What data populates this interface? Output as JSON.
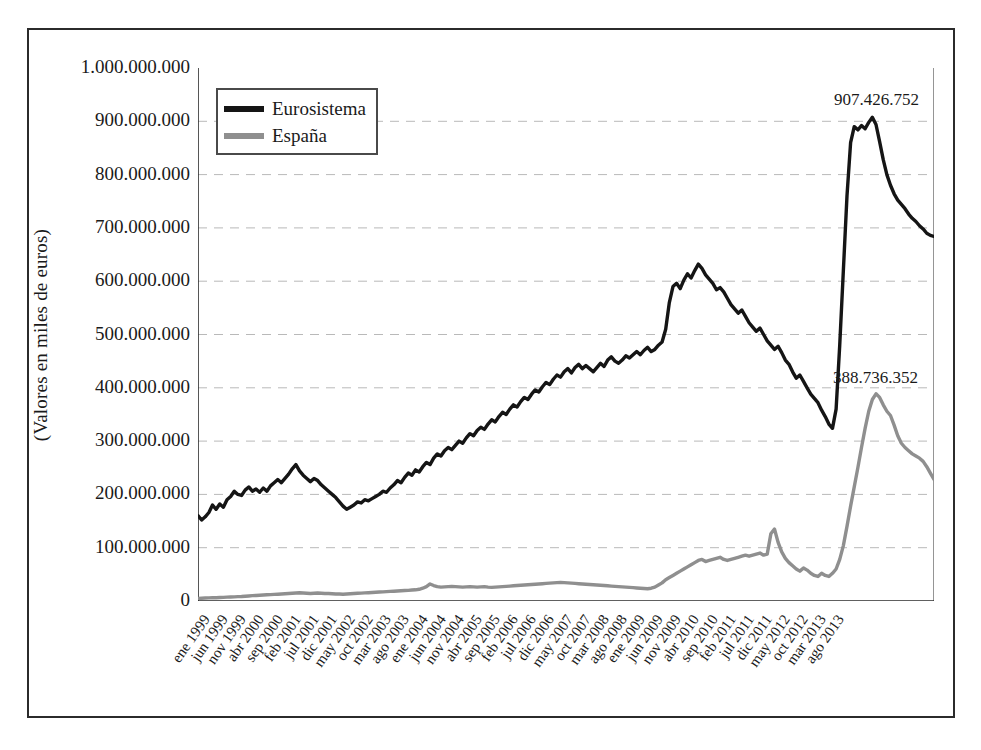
{
  "chart_data": {
    "type": "line",
    "title": "",
    "subtitle": "",
    "xlabel": "",
    "ylabel": "(Valores en miles de euros)",
    "ylim": [
      0,
      1000000000
    ],
    "ytick_step": 100000000,
    "grid": "horizontal-dashed",
    "legend_position": "top-left-inside",
    "x_axis_unit": "month",
    "x_start": "ene 1999",
    "x_end": "ago 2013",
    "x_tick_interval_months": 5,
    "y_tick_labels": [
      "1.000.000.000",
      "900.000.000",
      "800.000.000",
      "700.000.000",
      "600.000.000",
      "500.000.000",
      "400.000.000",
      "300.000.000",
      "200.000.000",
      "100.000.000",
      "0"
    ],
    "y_tick_values": [
      1000000000,
      900000000,
      800000000,
      700000000,
      600000000,
      500000000,
      400000000,
      300000000,
      200000000,
      100000000,
      0
    ],
    "xtick_labels": [
      "ene 1999",
      "jun 1999",
      "nov 1999",
      "abr 2000",
      "sep 2000",
      "feb 2001",
      "jul 2001",
      "dic 2001",
      "may 2002",
      "oct 2002",
      "mar 2003",
      "ago 2003",
      "ene 2004",
      "jun 2004",
      "nov 2004",
      "abr 2005",
      "sep 2005",
      "feb 2006",
      "jul 2006",
      "dic 2006",
      "may 2007",
      "oct 2007",
      "mar 2008",
      "ago 2008",
      "ene 2009",
      "jun 2009",
      "nov 2009",
      "abr 2010",
      "sep 2010",
      "feb 2011",
      "jul 2011",
      "dic 2011",
      "may 2012",
      "oct 2012",
      "mar 2013",
      "ago 2013"
    ],
    "series": [
      {
        "name": "Eurosistema",
        "color": "#151515",
        "values": [
          160000000,
          152000000,
          158000000,
          166000000,
          180000000,
          172000000,
          182000000,
          176000000,
          190000000,
          196000000,
          206000000,
          200000000,
          198000000,
          208000000,
          214000000,
          206000000,
          210000000,
          204000000,
          212000000,
          206000000,
          216000000,
          222000000,
          228000000,
          222000000,
          230000000,
          238000000,
          248000000,
          256000000,
          244000000,
          236000000,
          230000000,
          224000000,
          230000000,
          226000000,
          218000000,
          212000000,
          206000000,
          200000000,
          194000000,
          186000000,
          178000000,
          172000000,
          176000000,
          180000000,
          186000000,
          184000000,
          190000000,
          188000000,
          192000000,
          196000000,
          200000000,
          206000000,
          204000000,
          212000000,
          218000000,
          226000000,
          222000000,
          232000000,
          240000000,
          236000000,
          246000000,
          242000000,
          252000000,
          260000000,
          256000000,
          268000000,
          276000000,
          272000000,
          282000000,
          288000000,
          284000000,
          292000000,
          300000000,
          296000000,
          306000000,
          314000000,
          310000000,
          320000000,
          326000000,
          322000000,
          332000000,
          340000000,
          336000000,
          346000000,
          354000000,
          350000000,
          360000000,
          368000000,
          364000000,
          374000000,
          382000000,
          378000000,
          388000000,
          396000000,
          392000000,
          402000000,
          410000000,
          406000000,
          416000000,
          424000000,
          420000000,
          430000000,
          436000000,
          428000000,
          438000000,
          444000000,
          436000000,
          442000000,
          436000000,
          430000000,
          438000000,
          446000000,
          440000000,
          452000000,
          458000000,
          450000000,
          446000000,
          452000000,
          460000000,
          456000000,
          462000000,
          468000000,
          462000000,
          470000000,
          476000000,
          468000000,
          472000000,
          480000000,
          486000000,
          510000000,
          560000000,
          590000000,
          596000000,
          586000000,
          602000000,
          614000000,
          606000000,
          620000000,
          632000000,
          624000000,
          612000000,
          604000000,
          596000000,
          584000000,
          588000000,
          580000000,
          568000000,
          556000000,
          548000000,
          540000000,
          546000000,
          534000000,
          522000000,
          514000000,
          506000000,
          512000000,
          500000000,
          488000000,
          480000000,
          472000000,
          478000000,
          466000000,
          452000000,
          444000000,
          430000000,
          418000000,
          424000000,
          412000000,
          400000000,
          388000000,
          380000000,
          372000000,
          358000000,
          346000000,
          332000000,
          324000000,
          360000000,
          480000000,
          620000000,
          760000000,
          860000000,
          890000000,
          884000000,
          892000000,
          886000000,
          898000000,
          907426752,
          894000000,
          862000000,
          828000000,
          800000000,
          780000000,
          764000000,
          752000000,
          744000000,
          736000000,
          726000000,
          718000000,
          712000000,
          704000000,
          698000000,
          690000000,
          686000000,
          684000000
        ]
      },
      {
        "name": "España",
        "color": "#8f8f8f",
        "values": [
          5000000,
          5200000,
          5500000,
          5800000,
          6000000,
          6200000,
          6500000,
          6800000,
          7200000,
          7500000,
          7800000,
          8200000,
          8500000,
          9000000,
          9500000,
          10000000,
          10400000,
          10800000,
          11200000,
          11600000,
          12000000,
          12400000,
          12800000,
          13200000,
          13600000,
          14000000,
          14500000,
          15000000,
          15400000,
          15000000,
          14600000,
          14200000,
          14600000,
          15000000,
          14600000,
          14200000,
          14000000,
          13600000,
          13200000,
          13000000,
          12800000,
          13200000,
          13600000,
          14000000,
          14400000,
          14800000,
          15200000,
          15600000,
          16000000,
          16400000,
          16800000,
          17200000,
          17600000,
          18000000,
          18400000,
          18800000,
          19200000,
          19600000,
          20000000,
          20500000,
          21000000,
          22000000,
          24000000,
          27000000,
          32000000,
          29000000,
          27000000,
          26000000,
          26500000,
          27000000,
          27500000,
          27000000,
          26500000,
          26000000,
          26500000,
          27000000,
          26500000,
          26000000,
          26500000,
          27000000,
          26000000,
          25500000,
          26000000,
          26500000,
          27000000,
          27500000,
          28000000,
          28500000,
          29000000,
          29500000,
          30000000,
          30500000,
          31000000,
          31500000,
          32000000,
          32500000,
          33000000,
          33500000,
          34000000,
          34500000,
          35000000,
          34500000,
          34000000,
          33500000,
          33000000,
          32500000,
          32000000,
          31500000,
          31000000,
          30500000,
          30000000,
          29500000,
          29000000,
          28500000,
          28000000,
          27500000,
          27000000,
          26500000,
          26000000,
          25500000,
          25000000,
          24500000,
          24000000,
          23500000,
          23000000,
          24000000,
          26000000,
          30000000,
          34000000,
          40000000,
          44000000,
          48000000,
          52000000,
          56000000,
          60000000,
          64000000,
          68000000,
          72000000,
          76000000,
          78000000,
          74000000,
          76000000,
          78000000,
          80000000,
          82000000,
          78000000,
          76000000,
          78000000,
          80000000,
          82000000,
          84000000,
          86000000,
          84000000,
          86000000,
          88000000,
          90000000,
          86000000,
          88000000,
          126000000,
          135000000,
          110000000,
          92000000,
          80000000,
          72000000,
          66000000,
          60000000,
          56000000,
          62000000,
          58000000,
          52000000,
          48000000,
          46000000,
          52000000,
          48000000,
          46000000,
          52000000,
          60000000,
          78000000,
          104000000,
          140000000,
          178000000,
          214000000,
          250000000,
          288000000,
          324000000,
          356000000,
          378000000,
          388736352,
          382000000,
          368000000,
          356000000,
          348000000,
          330000000,
          310000000,
          296000000,
          288000000,
          282000000,
          276000000,
          272000000,
          268000000,
          262000000,
          252000000,
          240000000,
          228000000
        ]
      }
    ],
    "annotations": [
      {
        "name": "eurosistema-peak",
        "label": "907.426.752",
        "value": 907426752,
        "series": "Eurosistema"
      },
      {
        "name": "espana-peak",
        "label": "388.736.352",
        "value": 388736352,
        "series": "España"
      }
    ]
  },
  "legend": {
    "items": [
      {
        "label": "Eurosistema",
        "color": "#151515"
      },
      {
        "label": "España",
        "color": "#8f8f8f"
      }
    ]
  },
  "axis": {
    "y_title": "(Valores en miles de euros)"
  }
}
